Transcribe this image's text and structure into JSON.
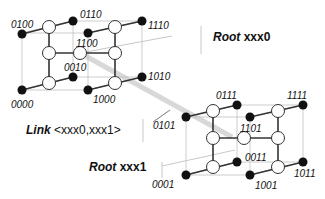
{
  "diagram": {
    "type": "hypercube-decomposition",
    "cube_upper": {
      "root_label": {
        "word": "Root",
        "value": "xxx0"
      },
      "nodes": [
        "0100",
        "0110",
        "1110",
        "1100",
        "0010",
        "1010",
        "0000",
        "1000"
      ]
    },
    "cube_lower": {
      "root_label": {
        "word": "Root",
        "value": "xxx1"
      },
      "nodes": [
        "0111",
        "1111",
        "0101",
        "1101",
        "0011",
        "1011",
        "0001",
        "1001"
      ]
    },
    "link_label": {
      "word": "Link",
      "value": "<xxx0,xxx1>"
    },
    "colors": {
      "node_fill_black": "#111111",
      "node_fill_white": "#ffffff",
      "edge_dark": "#333333",
      "edge_light": "#bdbdbd",
      "link_band": "#d8d8d8"
    }
  },
  "labels": {
    "l0100": "0100",
    "l0110": "0110",
    "l1110": "1110",
    "l1100": "1100",
    "l0010": "0010",
    "l1010": "1010",
    "l0000": "0000",
    "l1000": "1000",
    "l0111": "0111",
    "l1111": "1111",
    "l0101": "0101",
    "l1101": "1101",
    "l0011": "0011",
    "l1011": "1011",
    "l0001": "0001",
    "l1001": "1001",
    "root0_word": "Root",
    "root0_value": "xxx0",
    "root1_word": "Root",
    "root1_value": "xxx1",
    "link_word": "Link",
    "link_value": "<xxx0,xxx1>"
  }
}
